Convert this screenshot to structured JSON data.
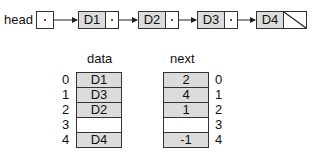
{
  "linked_list": {
    "head_label": "head",
    "nodes": [
      {
        "data": "D1",
        "next": "pointer"
      },
      {
        "data": "D2",
        "next": "pointer"
      },
      {
        "data": "D3",
        "next": "pointer"
      },
      {
        "data": "D4",
        "next": "null"
      }
    ]
  },
  "arrays": {
    "data": {
      "title": "data",
      "cells": [
        "D1",
        "D3",
        "D2",
        "",
        "D4"
      ]
    },
    "next": {
      "title": "next",
      "cells": [
        "2",
        "4",
        "1",
        "",
        "-1"
      ]
    },
    "indices": [
      "0",
      "1",
      "2",
      "3",
      "4"
    ]
  },
  "colors": {
    "cell_fill": "#dcdcdc",
    "empty_fill": "#ffffff",
    "stroke": "#333333"
  }
}
